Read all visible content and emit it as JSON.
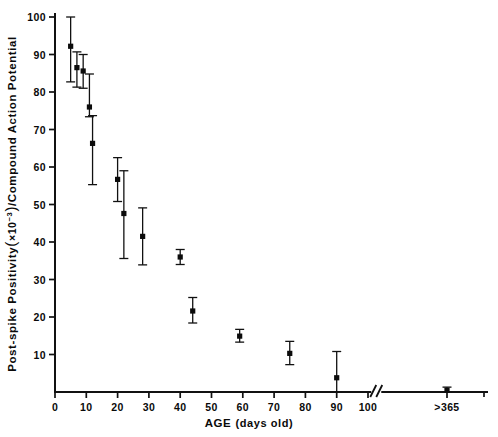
{
  "chart_data": {
    "type": "scatter",
    "title": "",
    "xlabel_main": "AGE",
    "xlabel_sub": "(days old)",
    "ylabel_part1": "Post-spike Positivity",
    "ylabel_openparen": "(",
    "ylabel_times": "×10",
    "ylabel_exponent": "−3",
    "ylabel_closeparen": ")",
    "ylabel_part2": "/Compound Action Potential",
    "xticklabels": [
      "0",
      "10",
      "20",
      "30",
      "40",
      "50",
      "60",
      "70",
      "80",
      "90",
      "100",
      ">365"
    ],
    "xtickvalues": [
      0,
      10,
      20,
      30,
      40,
      50,
      60,
      70,
      80,
      90,
      100,
      365
    ],
    "yticklabels": [
      "0",
      "10",
      "20",
      "30",
      "40",
      "50",
      "60",
      "70",
      "80",
      "90",
      "100"
    ],
    "ytickvalues": [
      0,
      10,
      20,
      30,
      40,
      50,
      60,
      70,
      80,
      90,
      100
    ],
    "xlim": [
      0,
      110
    ],
    "ylim": [
      0,
      100
    ],
    "grid": false,
    "legend": false,
    "axis_break": {
      "present": true,
      "symbol": "//",
      "after_value": 102,
      "note": "axis break between 100 and >365"
    },
    "points": [
      {
        "x": 5,
        "y": 92.2,
        "err_low": 9.5,
        "err_high": 7.8,
        "label": "5 days"
      },
      {
        "x": 7,
        "y": 86.5,
        "err_low": 5.2,
        "err_high": 4.2,
        "label": "7 days"
      },
      {
        "x": 9,
        "y": 85.6,
        "err_low": 4.6,
        "err_high": 4.4,
        "label": "9 days"
      },
      {
        "x": 11,
        "y": 76.0,
        "err_low": 2.6,
        "err_high": 8.8,
        "label": "11 days"
      },
      {
        "x": 12,
        "y": 66.3,
        "err_low": 11.0,
        "err_high": 7.4,
        "label": "12 days"
      },
      {
        "x": 20,
        "y": 56.7,
        "err_low": 5.9,
        "err_high": 5.8,
        "label": "20 days"
      },
      {
        "x": 22,
        "y": 47.6,
        "err_low": 12.0,
        "err_high": 11.4,
        "label": "22 days"
      },
      {
        "x": 28,
        "y": 41.5,
        "err_low": 7.6,
        "err_high": 7.6,
        "label": "28 days"
      },
      {
        "x": 40,
        "y": 36.0,
        "err_low": 2.0,
        "err_high": 2.0,
        "label": "40 days"
      },
      {
        "x": 44,
        "y": 21.6,
        "err_low": 3.2,
        "err_high": 3.6,
        "label": "44 days"
      },
      {
        "x": 59,
        "y": 14.9,
        "err_low": 1.6,
        "err_high": 1.8,
        "label": "59 days"
      },
      {
        "x": 75,
        "y": 10.3,
        "err_low": 3.0,
        "err_high": 3.2,
        "label": "75 days"
      },
      {
        "x": 90,
        "y": 3.8,
        "err_low": 3.8,
        "err_high": 7.0,
        "label": "90 days"
      },
      {
        "x": 365,
        "y": 0.5,
        "err_low": 0.5,
        "err_high": 0.8,
        "label": ">365 days"
      }
    ]
  }
}
